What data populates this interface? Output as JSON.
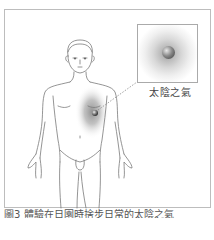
{
  "figure": {
    "inset_label": "太陰之氣",
    "caption": "圖3 體驗在日園時捨步日常的太陰之氣",
    "colors": {
      "line_art": "#7a7a7a",
      "frame_border": "#bdbdbd",
      "shading": "#8c8c8c",
      "text": "#444444"
    }
  }
}
